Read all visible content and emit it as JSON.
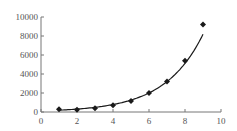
{
  "chart_data": {
    "type": "scatter",
    "title": "",
    "xlabel": "",
    "ylabel": "",
    "xlim": [
      0,
      10
    ],
    "ylim": [
      0,
      10000
    ],
    "x_ticks": [
      "0",
      "2",
      "4",
      "6",
      "8",
      "10"
    ],
    "y_ticks": [
      "0",
      "2000",
      "4000",
      "6000",
      "8000",
      "10000"
    ],
    "grid": false,
    "legend": null,
    "series": [
      {
        "name": "data",
        "marker": "diamond",
        "color": "#1a1a1a",
        "x": [
          1,
          2,
          3,
          4,
          5,
          6,
          7,
          8,
          9
        ],
        "y": [
          300,
          250,
          400,
          700,
          1150,
          2000,
          3200,
          5400,
          9200
        ]
      }
    ],
    "fit_curve": {
      "type": "exponential",
      "color": "#1a1a1a"
    }
  }
}
